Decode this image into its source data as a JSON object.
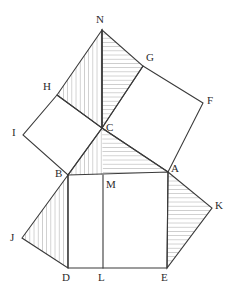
{
  "figure": {
    "type": "geometric-diagram",
    "width": 232,
    "height": 299,
    "background_color": "#ffffff",
    "stroke_color": "#3a3a3a",
    "hatch_color": "#8c8c8c"
  },
  "points": {
    "N": {
      "label": "N",
      "x": 102,
      "y": 30,
      "label_x": 96,
      "label_y": 14
    },
    "C": {
      "label": "C",
      "x": 102,
      "y": 128,
      "label_x": 106,
      "label_y": 122
    },
    "B": {
      "label": "B",
      "x": 68,
      "y": 175,
      "label_x": 55,
      "label_y": 168
    },
    "A": {
      "label": "A",
      "x": 168,
      "y": 172,
      "label_x": 171,
      "label_y": 163
    },
    "H": {
      "label": "H",
      "x": 57,
      "y": 95,
      "label_x": 43,
      "label_y": 81
    },
    "I": {
      "label": "I",
      "x": 23,
      "y": 135,
      "label_x": 12,
      "label_y": 127
    },
    "G": {
      "label": "G",
      "x": 143,
      "y": 66,
      "label_x": 146,
      "label_y": 52
    },
    "F": {
      "label": "F",
      "x": 203,
      "y": 103,
      "label_x": 207,
      "label_y": 95
    },
    "D": {
      "label": "D",
      "x": 68,
      "y": 268,
      "label_x": 62,
      "label_y": 272
    },
    "E": {
      "label": "E",
      "x": 167,
      "y": 268,
      "label_x": 161,
      "label_y": 272
    },
    "L": {
      "label": "L",
      "x": 103,
      "y": 268,
      "label_x": 98,
      "label_y": 272
    },
    "M": {
      "label": "M",
      "x": 103,
      "y": 175,
      "label_x": 106,
      "label_y": 179
    },
    "J": {
      "label": "J",
      "x": 22,
      "y": 238,
      "label_x": 10,
      "label_y": 232
    },
    "K": {
      "label": "K",
      "x": 212,
      "y": 208,
      "label_x": 215,
      "label_y": 200
    }
  },
  "shapes": {
    "hypotenuse_square": {
      "name": "square-BAED",
      "vertices": "B,A,E,D",
      "polygon": "68,175 168,172 167,268 68,268",
      "filled": false
    },
    "left_leg_square": {
      "name": "square-HICB",
      "vertices": "H,I,B,C",
      "polygon": "57,95 23,135 68,175 102,128",
      "filled": false
    },
    "right_leg_square": {
      "name": "square-CGFA",
      "vertices": "C,G,F,A",
      "polygon": "102,128 143,66 203,103 168,172",
      "filled": false
    },
    "triangle_NHC": {
      "name": "triangle-NHC",
      "polygon": "102,30 57,95 102,128",
      "hatch": "vertical"
    },
    "triangle_NCG": {
      "name": "triangle-NCG",
      "polygon": "102,30 102,128 143,66",
      "hatch": "horizontal"
    },
    "triangle_CBM": {
      "name": "triangle-CBM",
      "polygon": "102,128 68,175 103,175",
      "hatch": "vertical"
    },
    "triangle_CMA": {
      "name": "triangle-CMA",
      "polygon": "102,128 103,175 168,172",
      "hatch": "horizontal"
    },
    "triangle_BJD": {
      "name": "triangle-BJD",
      "polygon": "68,175 22,238 68,268",
      "hatch": "vertical"
    },
    "triangle_AKE": {
      "name": "triangle-AKE",
      "polygon": "168,172 212,208 167,268",
      "hatch": "horizontal"
    }
  },
  "segments": [
    {
      "name": "segment-ML",
      "from": "M",
      "to": "L",
      "path": "103,175 103,268"
    },
    {
      "name": "segment-NC",
      "from": "N",
      "to": "C",
      "path": "102,30 102,128"
    },
    {
      "name": "segment-CB",
      "from": "C",
      "to": "B",
      "path": "102,128 68,175"
    },
    {
      "name": "segment-CA",
      "from": "C",
      "to": "A",
      "path": "102,128 168,172"
    },
    {
      "name": "segment-NH",
      "from": "N",
      "to": "H",
      "path": "102,30 57,95"
    },
    {
      "name": "segment-NG",
      "from": "N",
      "to": "G",
      "path": "102,30 143,66"
    },
    {
      "name": "segment-BJ",
      "from": "B",
      "to": "J",
      "path": "68,175 22,238"
    },
    {
      "name": "segment-JD",
      "from": "J",
      "to": "D",
      "path": "22,238 68,268"
    },
    {
      "name": "segment-AK",
      "from": "A",
      "to": "K",
      "path": "168,172 212,208"
    },
    {
      "name": "segment-KE",
      "from": "K",
      "to": "E",
      "path": "212,208 167,268"
    }
  ]
}
